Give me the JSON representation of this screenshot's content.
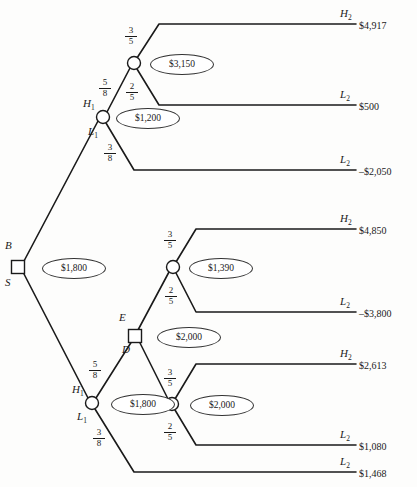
{
  "diagram": {
    "type": "decision-tree",
    "title": "",
    "root": {
      "label_top": "B",
      "label_bottom": "S",
      "ev": "$1,800"
    },
    "nodes": [
      {
        "id": "root",
        "kind": "decision",
        "x": 18,
        "y": 267,
        "ev": "$1,800"
      },
      {
        "id": "upper-h1",
        "kind": "chance",
        "x": 103,
        "y": 117,
        "ev": "$1,200"
      },
      {
        "id": "upper-c",
        "kind": "chance",
        "x": 134,
        "y": 63,
        "ev": "$3,150"
      },
      {
        "id": "mid-c",
        "kind": "chance",
        "x": 173,
        "y": 267,
        "ev": "$1,390"
      },
      {
        "id": "ed",
        "kind": "decision",
        "x": 135,
        "y": 336,
        "ev": "$2,000"
      },
      {
        "id": "lower-h1",
        "kind": "chance",
        "x": 92,
        "y": 403,
        "ev": "$1,800"
      },
      {
        "id": "lower-c",
        "kind": "chance",
        "x": 172,
        "y": 404,
        "ev": "$2,000"
      }
    ],
    "branch_labels": {
      "root_buy": "B",
      "root_sell": "S",
      "upper_h1": "H",
      "upper_h1_sub": "1",
      "upper_l1": "L",
      "upper_l1_sub": "1",
      "lower_h1": "H",
      "lower_h1_sub": "1",
      "lower_l1": "L",
      "lower_l1_sub": "1",
      "node_e": "E",
      "node_d": "D"
    },
    "probabilities": [
      {
        "id": "p-upper-c-high",
        "num": "3",
        "den": "5",
        "x": 124,
        "y": 26
      },
      {
        "id": "p-upper-h1",
        "num": "5",
        "den": "8",
        "x": 98,
        "y": 78
      },
      {
        "id": "p-upper-c-low",
        "num": "2",
        "den": "5",
        "x": 125,
        "y": 82
      },
      {
        "id": "p-upper-l1",
        "num": "3",
        "den": "8",
        "x": 103,
        "y": 143
      },
      {
        "id": "p-mid-c-high",
        "num": "3",
        "den": "5",
        "x": 163,
        "y": 230
      },
      {
        "id": "p-mid-c-low",
        "num": "2",
        "den": "5",
        "x": 164,
        "y": 286
      },
      {
        "id": "p-lower-h1",
        "num": "5",
        "den": "8",
        "x": 88,
        "y": 360
      },
      {
        "id": "p-lower-c-high",
        "num": "3",
        "den": "5",
        "x": 163,
        "y": 368
      },
      {
        "id": "p-lower-l1",
        "num": "3",
        "den": "8",
        "x": 92,
        "y": 428
      },
      {
        "id": "p-lower-c-low",
        "num": "2",
        "den": "5",
        "x": 163,
        "y": 422
      }
    ],
    "terminals": [
      {
        "id": "t1",
        "outcome": "H",
        "sub": "2",
        "value": "$4,917",
        "y": 24
      },
      {
        "id": "t2",
        "outcome": "L",
        "sub": "2",
        "value": "$500",
        "y": 105
      },
      {
        "id": "t3",
        "outcome": "L",
        "sub": "2",
        "value": "–$2,050",
        "y": 170
      },
      {
        "id": "t4",
        "outcome": "H",
        "sub": "2",
        "value": "$4,850",
        "y": 229
      },
      {
        "id": "t5",
        "outcome": "L",
        "sub": "2",
        "value": "–$3,800",
        "y": 312
      },
      {
        "id": "t6",
        "outcome": "H",
        "sub": "2",
        "value": "$2,613",
        "y": 364
      },
      {
        "id": "t7",
        "outcome": "L",
        "sub": "2",
        "value": "$1,080",
        "y": 445
      },
      {
        "id": "t8",
        "outcome": "L",
        "sub": "2",
        "value": "$1,468",
        "y": 472
      }
    ],
    "expected_values": [
      {
        "id": "ev-root",
        "text": "$1,800",
        "x": 42,
        "y": 258,
        "w": 62,
        "h": 19
      },
      {
        "id": "ev-upper-c",
        "text": "$3,150",
        "x": 150,
        "y": 54,
        "w": 62,
        "h": 19
      },
      {
        "id": "ev-upper-h1",
        "text": "$1,200",
        "x": 116,
        "y": 108,
        "w": 62,
        "h": 19
      },
      {
        "id": "ev-mid-c",
        "text": "$1,390",
        "x": 189,
        "y": 258,
        "w": 62,
        "h": 19
      },
      {
        "id": "ev-ed",
        "text": "$2,000",
        "x": 157,
        "y": 327,
        "w": 62,
        "h": 19
      },
      {
        "id": "ev-lower-h1",
        "text": "$1,800",
        "x": 111,
        "y": 394,
        "w": 62,
        "h": 19
      },
      {
        "id": "ev-lower-c",
        "text": "$2,000",
        "x": 190,
        "y": 395,
        "w": 62,
        "h": 19
      }
    ],
    "colors": {
      "stroke": "#1a1a1a",
      "node_fill": "#ffffff",
      "background": "#fdfdfc"
    }
  }
}
